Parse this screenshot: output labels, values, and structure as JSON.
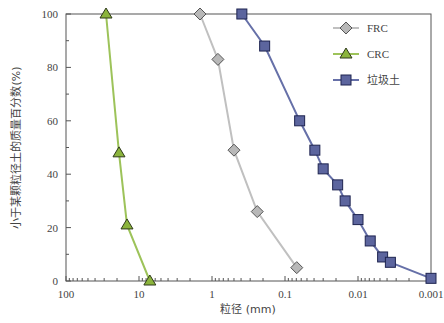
{
  "chart_data": {
    "type": "line",
    "title": "",
    "xlabel": "粒径 (mm)",
    "ylabel": "小于某颗粒径土的质量百分数(%)",
    "xscale": "log",
    "xaxis_reversed": true,
    "xlim": [
      100,
      0.001
    ],
    "ylim": [
      0,
      100
    ],
    "x_ticks": [
      "100",
      "10",
      "1",
      "0.1",
      "0.01",
      "0.001"
    ],
    "y_ticks": [
      "0",
      "20",
      "40",
      "60",
      "80",
      "100"
    ],
    "grid": false,
    "legend_position": "upper right",
    "series": [
      {
        "name": "FRC",
        "color": "#c0c0c0",
        "marker": "diamond",
        "marker_fill": "#b8b8b8",
        "x": [
          1.46,
          0.83,
          0.5,
          0.24,
          0.069
        ],
        "y": [
          100,
          83,
          49,
          26,
          5
        ]
      },
      {
        "name": "CRC",
        "color": "#9dc35a",
        "marker": "triangle",
        "marker_fill": "#8bb43c",
        "x": [
          28.3,
          18.8,
          14.6,
          7.1
        ],
        "y": [
          100,
          48,
          21,
          0
        ]
      },
      {
        "name": "垃圾土",
        "color": "#6670a8",
        "marker": "square",
        "marker_fill": "#5c659e",
        "x": [
          0.39,
          0.19,
          0.063,
          0.039,
          0.03,
          0.019,
          0.015,
          0.01,
          0.0068,
          0.0046,
          0.0036,
          0.001
        ],
        "y": [
          100,
          88,
          60,
          49,
          42,
          36,
          30,
          23,
          15,
          9,
          7,
          1
        ]
      }
    ]
  }
}
